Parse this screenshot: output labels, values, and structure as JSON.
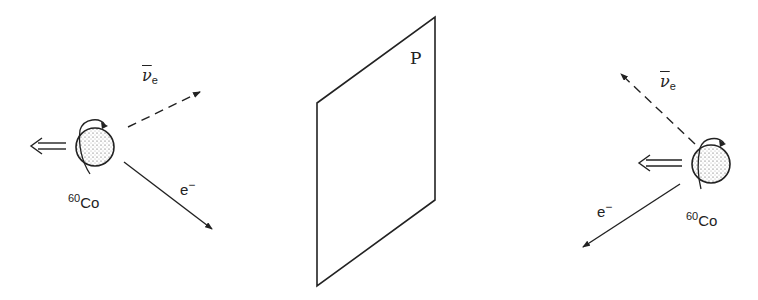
{
  "diagram": {
    "colors": {
      "line": "#222222",
      "background": "#ffffff"
    },
    "mirror_plane": {
      "label": "P"
    },
    "left_scene": {
      "nucleus": {
        "mass_number": "60",
        "element": "Co"
      },
      "electron": {
        "symbol": "e",
        "charge": "−"
      },
      "antineutrino": {
        "symbol": "ν",
        "subscript": "e"
      },
      "spin_arrow": "double-arrow-left"
    },
    "right_scene": {
      "nucleus": {
        "mass_number": "60",
        "element": "Co"
      },
      "electron": {
        "symbol": "e",
        "charge": "−"
      },
      "antineutrino": {
        "symbol": "ν",
        "subscript": "e"
      },
      "spin_arrow": "double-arrow-left"
    }
  }
}
